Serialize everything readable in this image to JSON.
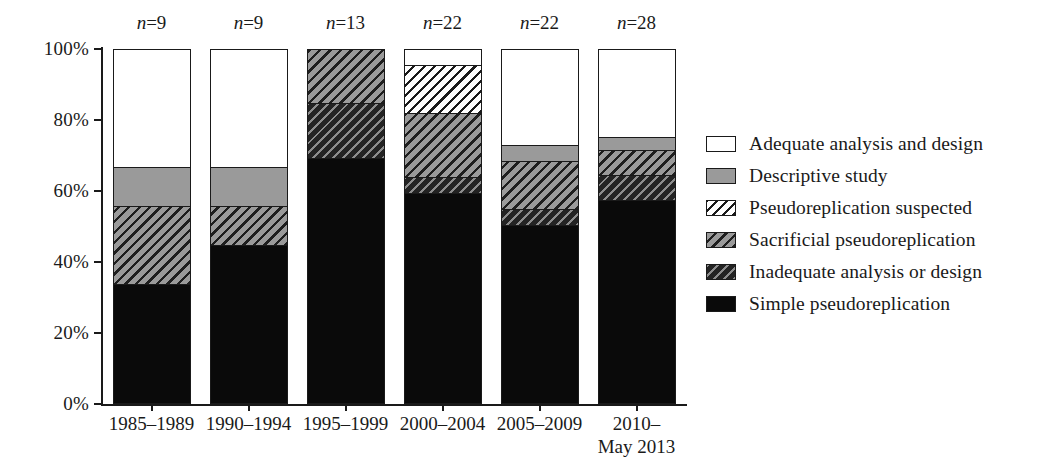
{
  "chart_data": {
    "type": "bar",
    "subtype": "stacked-percentage",
    "title": "",
    "xlabel": "",
    "ylabel": "",
    "ylim": [
      0,
      100
    ],
    "yticks": [
      "0%",
      "20%",
      "40%",
      "60%",
      "80%",
      "100%"
    ],
    "ytick_values": [
      0,
      20,
      40,
      60,
      80,
      100
    ],
    "grid": false,
    "legend_position": "right",
    "categories": [
      "1985–1989",
      "1990–1994",
      "1995–1999",
      "2000–2004",
      "2005–2009",
      "2010–\nMay 2013"
    ],
    "category_lines": [
      [
        "1985–1989"
      ],
      [
        "1990–1994"
      ],
      [
        "1995–1999"
      ],
      [
        "2000–2004"
      ],
      [
        "2005–2009"
      ],
      [
        "2010–",
        "May 2013"
      ]
    ],
    "sample_sizes": [
      "n=9",
      "n=9",
      "n=13",
      "n=22",
      "n=22",
      "n=28"
    ],
    "sample_size_values": [
      9,
      9,
      13,
      22,
      22,
      28
    ],
    "series": [
      {
        "name": "Simple pseudoreplication",
        "pattern": "solid-black",
        "values": [
          33.3,
          44.4,
          69.2,
          59.1,
          50.0,
          57.1
        ]
      },
      {
        "name": "Inadequate analysis or design",
        "pattern": "dark-hatch",
        "values": [
          0.0,
          0.0,
          15.4,
          4.5,
          4.5,
          7.1
        ]
      },
      {
        "name": "Sacrificial pseudoreplication",
        "pattern": "gray-hatch",
        "values": [
          22.2,
          11.1,
          15.4,
          18.2,
          13.6,
          7.1
        ]
      },
      {
        "name": "Pseudoreplication suspected",
        "pattern": "white-hatch",
        "values": [
          0.0,
          0.0,
          0.0,
          13.6,
          0.0,
          0.0
        ]
      },
      {
        "name": "Descriptive study",
        "pattern": "solid-gray",
        "values": [
          11.1,
          11.1,
          0.0,
          0.0,
          4.5,
          3.6
        ]
      },
      {
        "name": "Adequate analysis and design",
        "pattern": "white",
        "values": [
          33.3,
          33.3,
          0.0,
          4.5,
          27.3,
          25.0
        ]
      }
    ]
  },
  "legend": {
    "items": [
      {
        "label": "Adequate analysis and design",
        "pattern": "white"
      },
      {
        "label": "Descriptive study",
        "pattern": "solid-gray"
      },
      {
        "label": "Pseudoreplication suspected",
        "pattern": "white-hatch"
      },
      {
        "label": "Sacrificial pseudoreplication",
        "pattern": "gray-hatch"
      },
      {
        "label": "Inadequate analysis or design",
        "pattern": "dark-hatch"
      },
      {
        "label": "Simple pseudoreplication",
        "pattern": "solid-black"
      }
    ]
  },
  "colors": {
    "axis": "#1a1a1a",
    "black_fill": "#0a0a0a",
    "gray_fill": "#9a9a9a",
    "white_fill": "#ffffff",
    "dark_hatch_bg": "#232323",
    "background": "#ffffff"
  }
}
